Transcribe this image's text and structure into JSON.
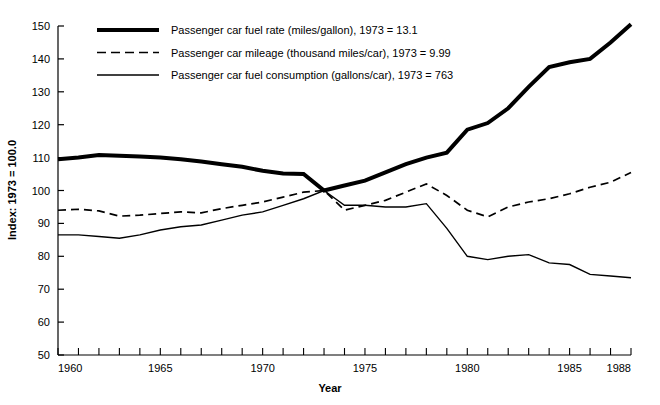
{
  "chart_data": {
    "type": "line",
    "title": "",
    "xlabel": "Year",
    "ylabel": "Index: 1973 = 100.0",
    "xlim": [
      1960,
      1988
    ],
    "ylim": [
      50,
      150
    ],
    "ytick_step": 10,
    "yticks": [
      50,
      60,
      70,
      80,
      90,
      100,
      110,
      120,
      130,
      140,
      150
    ],
    "xticks_labeled": [
      1960,
      1965,
      1970,
      1975,
      1980,
      1985,
      1988
    ],
    "xticks_all": [
      1960,
      1961,
      1962,
      1963,
      1964,
      1965,
      1966,
      1967,
      1968,
      1969,
      1970,
      1971,
      1972,
      1973,
      1974,
      1975,
      1976,
      1977,
      1978,
      1979,
      1980,
      1981,
      1982,
      1983,
      1984,
      1985,
      1986,
      1987,
      1988
    ],
    "grid": false,
    "legend_position": "top-left-inside",
    "x": [
      1960,
      1961,
      1962,
      1963,
      1964,
      1965,
      1966,
      1967,
      1968,
      1969,
      1970,
      1971,
      1972,
      1973,
      1974,
      1975,
      1976,
      1977,
      1978,
      1979,
      1980,
      1981,
      1982,
      1983,
      1984,
      1985,
      1986,
      1987,
      1988
    ],
    "series": [
      {
        "name": "Passenger car fuel rate (miles/gallon), 1973 = 13.1",
        "short_name": "fuel-rate",
        "style": "thick-solid",
        "base_year": 1973,
        "base_value": "13.1",
        "base_units": "miles/gallon",
        "values": [
          109.5,
          110.0,
          110.8,
          110.6,
          110.3,
          110.0,
          109.5,
          108.8,
          108.0,
          107.2,
          106.0,
          105.2,
          105.0,
          100.0,
          101.5,
          103.0,
          105.5,
          108.0,
          110.0,
          111.5,
          118.5,
          120.5,
          125.0,
          131.5,
          137.5,
          139.0,
          140.0,
          145.0,
          150.5
        ]
      },
      {
        "name": "Passenger car mileage (thousand miles/car), 1973 = 9.99",
        "short_name": "mileage",
        "style": "dashed",
        "base_year": 1973,
        "base_value": "9.99",
        "base_units": "thousand miles/car",
        "values": [
          94.0,
          94.3,
          93.8,
          92.2,
          92.5,
          93.0,
          93.5,
          93.2,
          94.5,
          95.5,
          96.5,
          98.0,
          99.5,
          100.0,
          94.0,
          95.5,
          97.0,
          99.5,
          102.0,
          98.5,
          94.0,
          92.0,
          95.0,
          96.5,
          97.5,
          99.0,
          101.0,
          102.5,
          105.5
        ]
      },
      {
        "name": "Passenger car fuel consumption (gallons/car), 1973 = 763",
        "short_name": "fuel-consumption",
        "style": "thin-solid",
        "base_year": 1973,
        "base_value": "763",
        "base_units": "gallons/car",
        "values": [
          86.5,
          86.5,
          86.0,
          85.5,
          86.5,
          88.0,
          89.0,
          89.5,
          91.0,
          92.5,
          93.5,
          95.5,
          97.5,
          100.0,
          95.5,
          95.5,
          95.0,
          95.0,
          96.0,
          88.5,
          80.0,
          79.0,
          80.0,
          80.5,
          78.0,
          77.5,
          74.5,
          74.0,
          73.5
        ]
      }
    ]
  }
}
